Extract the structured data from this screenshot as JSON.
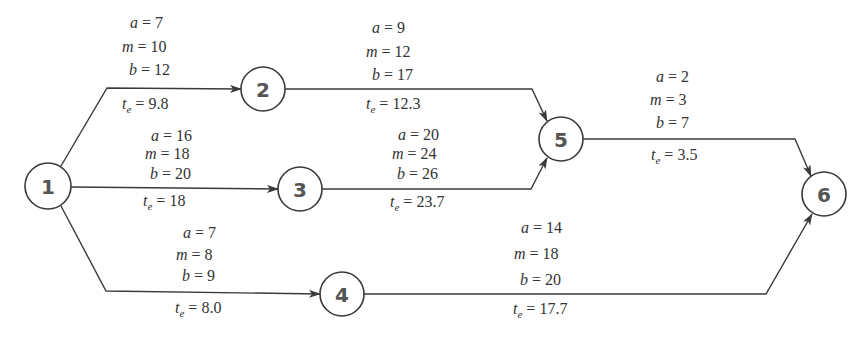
{
  "diagram": {
    "title": "",
    "nodes": [
      {
        "id": "1",
        "label": "1",
        "x": 48,
        "y": 186,
        "r": 23
      },
      {
        "id": "2",
        "label": "2",
        "x": 263,
        "y": 89,
        "r": 22
      },
      {
        "id": "3",
        "label": "3",
        "x": 300,
        "y": 189,
        "r": 22
      },
      {
        "id": "4",
        "label": "4",
        "x": 342,
        "y": 294,
        "r": 22
      },
      {
        "id": "5",
        "label": "5",
        "x": 561,
        "y": 139,
        "r": 22
      },
      {
        "id": "6",
        "label": "6",
        "x": 824,
        "y": 194,
        "r": 22
      }
    ],
    "edges": [
      {
        "id": "e12",
        "from": "1",
        "to": "2",
        "a": "7",
        "m": "10",
        "b": "12",
        "te": "9.8",
        "labels": {
          "a": "a",
          "m": "m",
          "b": "b",
          "t": "t",
          "t_sub": "e",
          "eq": "="
        }
      },
      {
        "id": "e13",
        "from": "1",
        "to": "3",
        "a": "16",
        "m": "18",
        "b": "20",
        "te": "18",
        "labels": {
          "a": "a",
          "m": "m",
          "b": "b",
          "t": "t",
          "t_sub": "e",
          "eq": "="
        }
      },
      {
        "id": "e14",
        "from": "1",
        "to": "4",
        "a": "7",
        "m": "8",
        "b": "9",
        "te": "8.0",
        "labels": {
          "a": "a",
          "m": "m",
          "b": "b",
          "t": "t",
          "t_sub": "e",
          "eq": "="
        }
      },
      {
        "id": "e25",
        "from": "2",
        "to": "5",
        "a": "9",
        "m": "12",
        "b": "17",
        "te": "12.3",
        "labels": {
          "a": "a",
          "m": "m",
          "b": "b",
          "t": "t",
          "t_sub": "e",
          "eq": "="
        }
      },
      {
        "id": "e35",
        "from": "3",
        "to": "5",
        "a": "20",
        "m": "24",
        "b": "26",
        "te": "23.7",
        "labels": {
          "a": "a",
          "m": "m",
          "b": "b",
          "t": "t",
          "t_sub": "e",
          "eq": "="
        }
      },
      {
        "id": "e56",
        "from": "5",
        "to": "6",
        "a": "2",
        "m": "3",
        "b": "7",
        "te": "3.5",
        "labels": {
          "a": "a",
          "m": "m",
          "b": "b",
          "t": "t",
          "t_sub": "e",
          "eq": "="
        }
      },
      {
        "id": "e46",
        "from": "4",
        "to": "6",
        "a": "14",
        "m": "18",
        "b": "20",
        "te": "17.7",
        "labels": {
          "a": "a",
          "m": "m",
          "b": "b",
          "t": "t",
          "t_sub": "e",
          "eq": "="
        }
      }
    ]
  },
  "colors": {
    "line": "#3a3a3a",
    "node_text": "#555555",
    "label_text": "#333333",
    "background": "#ffffff"
  }
}
